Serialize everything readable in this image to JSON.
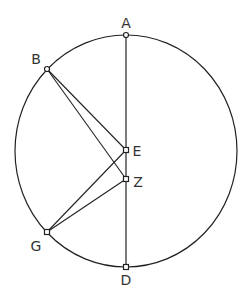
{
  "diagram": {
    "type": "geometry",
    "circle": {
      "cx": 126,
      "cy": 151,
      "rx": 111,
      "ry": 116,
      "stroke": "#222222"
    },
    "points": {
      "A": {
        "label": "A",
        "x": 126,
        "y": 35,
        "lx": 126,
        "ly": 28
      },
      "B": {
        "label": "B",
        "x": 47,
        "y": 69,
        "lx": 36,
        "ly": 64
      },
      "E": {
        "label": "E",
        "x": 126,
        "y": 150,
        "lx": 137,
        "ly": 156
      },
      "Z": {
        "label": "Z",
        "x": 126,
        "y": 179,
        "lx": 138,
        "ly": 187
      },
      "G": {
        "label": "G",
        "x": 47,
        "y": 232,
        "lx": 36,
        "ly": 251
      },
      "D": {
        "label": "D",
        "x": 126,
        "y": 267,
        "lx": 126,
        "ly": 285
      }
    },
    "segments": [
      [
        "A",
        "D"
      ],
      [
        "B",
        "E"
      ],
      [
        "B",
        "Z"
      ],
      [
        "G",
        "E"
      ],
      [
        "G",
        "Z"
      ]
    ],
    "line_color": "#222222",
    "point_fill": "#ffffff"
  }
}
